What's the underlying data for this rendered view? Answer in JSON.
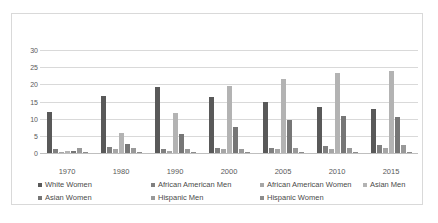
{
  "chart_data": {
    "type": "bar",
    "title": "",
    "subtitle": "",
    "xlabel": "",
    "ylabel": "",
    "ylim": [
      0,
      30
    ],
    "yticks": [
      0,
      5,
      10,
      15,
      20,
      25,
      30
    ],
    "ytick_labels": [
      "0",
      "5",
      "10",
      "15",
      "20",
      "25",
      "30"
    ],
    "grid": "horizontal",
    "legend_position": "bottom",
    "categories": [
      "1970",
      "1980",
      "1990",
      "2000",
      "2005",
      "2010",
      "2015"
    ],
    "series": [
      {
        "name": "White Women",
        "color": "#595959",
        "values": [
          11.9,
          16.5,
          19.3,
          16.4,
          14.9,
          13.4,
          12.8
        ]
      },
      {
        "name": "African American Men",
        "color": "#808080",
        "values": [
          1.3,
          1.8,
          1.1,
          1.6,
          1.4,
          2.0,
          2.2
        ]
      },
      {
        "name": "African American Women",
        "color": "#a6a6a6",
        "values": [
          0.4,
          1.2,
          0.7,
          1.1,
          1.1,
          1.2,
          1.4
        ]
      },
      {
        "name": "Asian Men",
        "color": "#b3b3b3",
        "values": [
          0.5,
          5.9,
          11.7,
          19.5,
          21.6,
          23.2,
          24.0
        ]
      },
      {
        "name": "Asian Women",
        "color": "#767676",
        "values": [
          0.6,
          2.7,
          5.6,
          7.7,
          9.5,
          10.7,
          10.4
        ]
      },
      {
        "name": "Hispanic Men",
        "color": "#999999",
        "values": [
          1.4,
          1.5,
          1.1,
          1.2,
          1.6,
          1.4,
          2.2
        ]
      },
      {
        "name": "Hispanic Women",
        "color": "#8c8c8c",
        "values": [
          0.1,
          0.2,
          0.2,
          0.4,
          0.4,
          0.4,
          0.3
        ]
      }
    ]
  },
  "legend": {
    "rows": [
      [
        {
          "label": "White Women",
          "color": "#595959",
          "left": 0
        },
        {
          "label": "African American Men",
          "color": "#808080",
          "left": 113
        },
        {
          "label": "African American Women",
          "color": "#a6a6a6",
          "left": 222
        },
        {
          "label": "Asian Men",
          "color": "#b3b3b3",
          "left": 325
        }
      ],
      [
        {
          "label": "Asian Women",
          "color": "#767676",
          "left": 0
        },
        {
          "label": "Hispanic Men",
          "color": "#999999",
          "left": 113
        },
        {
          "label": "Hispanic Women",
          "color": "#8c8c8c",
          "left": 222
        }
      ]
    ]
  }
}
